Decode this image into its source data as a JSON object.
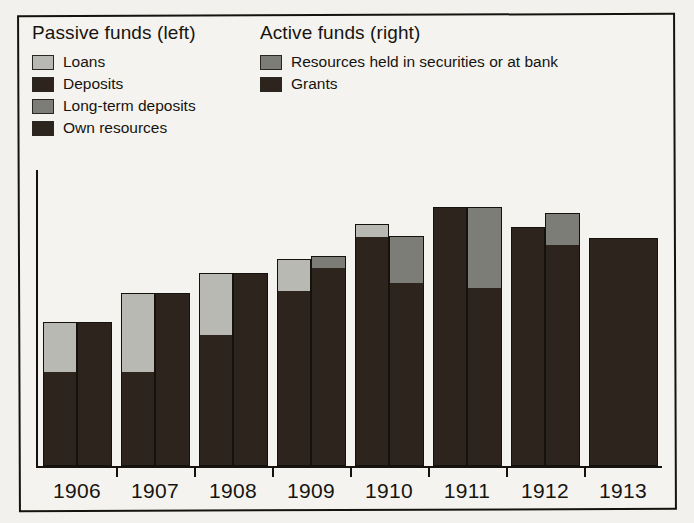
{
  "legend": {
    "passive": {
      "heading": "Passive funds (left)",
      "items": [
        {
          "label": "Loans",
          "color": "#b9b9b4"
        },
        {
          "label": "Deposits",
          "color": "#2c241d"
        },
        {
          "label": "Long-term deposits",
          "color": "#7d7d78"
        },
        {
          "label": "Own resources",
          "color": "#2c241d"
        }
      ]
    },
    "active": {
      "heading": "Active funds (right)",
      "items": [
        {
          "label": "Resources held in securities or at bank",
          "color": "#7d7d78"
        },
        {
          "label": "Grants",
          "color": "#2c241d"
        }
      ]
    }
  },
  "chart_data": {
    "type": "bar",
    "title": "",
    "subtitle": "",
    "xlabel": "",
    "ylabel": "",
    "grid": false,
    "legend_position": "top",
    "note": "Paired stacked bars per year: left bar = passive funds, right bar = active funds. Values are relative heights read off the plot in arbitrary units (baseline = 0, plot top = 100).",
    "ylim": [
      0,
      100
    ],
    "categories": [
      "1906",
      "1907",
      "1908",
      "1909",
      "1910",
      "1911",
      "1912",
      "1913"
    ],
    "series": [
      {
        "name": "Passive funds (left) - Deposits / Own resources",
        "side": "left",
        "segment": "dark",
        "color": "#2c241d",
        "values": [
          33,
          33,
          46,
          61,
          80,
          90,
          83,
          0
        ]
      },
      {
        "name": "Passive funds (left) - Loans",
        "side": "left",
        "segment": "grey",
        "color": "#b9b9b4",
        "values": [
          17,
          27,
          21,
          11,
          4,
          0,
          0,
          0
        ]
      },
      {
        "name": "Active funds (right) - Grants",
        "side": "right",
        "segment": "dark",
        "color": "#2c241d",
        "values": [
          50,
          60,
          67,
          69,
          64,
          62,
          77,
          79
        ]
      },
      {
        "name": "Active funds (right) - Resources held in securities or at bank",
        "side": "right",
        "segment": "grey",
        "color": "#7d7d78",
        "values": [
          0,
          0,
          0,
          4,
          16,
          28,
          11,
          0
        ]
      }
    ],
    "bars": [
      {
        "year": "1906",
        "left": {
          "total": 50,
          "dark": 33,
          "grey": 17
        },
        "right": {
          "total": 50,
          "dark": 50,
          "grey": 0
        }
      },
      {
        "year": "1907",
        "left": {
          "total": 60,
          "dark": 33,
          "grey": 27
        },
        "right": {
          "total": 60,
          "dark": 60,
          "grey": 0
        }
      },
      {
        "year": "1908",
        "left": {
          "total": 67,
          "dark": 46,
          "grey": 21
        },
        "right": {
          "total": 67,
          "dark": 67,
          "grey": 0
        }
      },
      {
        "year": "1909",
        "left": {
          "total": 72,
          "dark": 61,
          "grey": 11
        },
        "right": {
          "total": 73,
          "dark": 69,
          "grey": 4
        }
      },
      {
        "year": "1910",
        "left": {
          "total": 84,
          "dark": 80,
          "grey": 4
        },
        "right": {
          "total": 80,
          "dark": 64,
          "grey": 16
        }
      },
      {
        "year": "1911",
        "left": {
          "total": 90,
          "dark": 90,
          "grey": 0
        },
        "right": {
          "total": 90,
          "dark": 62,
          "grey": 28
        }
      },
      {
        "year": "1912",
        "left": {
          "total": 83,
          "dark": 83,
          "grey": 0
        },
        "right": {
          "total": 88,
          "dark": 77,
          "grey": 11
        }
      },
      {
        "year": "1913",
        "left": {
          "total": 0,
          "dark": 0,
          "grey": 0
        },
        "right": {
          "total": 79,
          "dark": 79,
          "grey": 0
        }
      }
    ]
  }
}
